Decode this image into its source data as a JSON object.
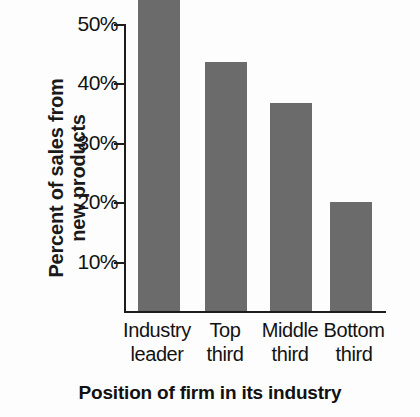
{
  "chart_data": {
    "type": "bar",
    "title": "",
    "xlabel": "Position of firm in its industry",
    "ylabel": "Percent of sales from new products",
    "ylabel_lines": [
      "Percent of sales from",
      "new products"
    ],
    "categories": [
      "Industry leader",
      "Top third",
      "Middle third",
      "Bottom third"
    ],
    "category_lines": [
      [
        "Industry",
        "leader"
      ],
      [
        "Top",
        "third"
      ],
      [
        "Middle",
        "third"
      ],
      [
        "Bottom",
        "third"
      ]
    ],
    "values": [
      49,
      34,
      27,
      10.5
    ],
    "value_labels": [
      "49%",
      "34%",
      "27%",
      "10.5%"
    ],
    "ylim": [
      0,
      50
    ],
    "ytick_values": [
      10,
      20,
      30,
      40,
      50
    ],
    "ytick_labels": [
      "10%",
      "20%",
      "30%",
      "40%",
      "50%"
    ],
    "grid": false,
    "legend": null,
    "bar_color": "#6b6b6b",
    "axis_color": "#1d1d1d",
    "background_color": "#fdfdfd"
  }
}
